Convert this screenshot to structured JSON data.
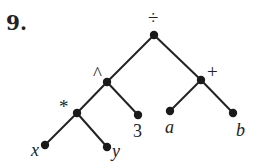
{
  "problem": {
    "number": "9."
  },
  "tree": {
    "nodes": [
      {
        "id": "div",
        "label": "÷",
        "type": "operator",
        "x": 154,
        "y": 35,
        "lx": 148,
        "ly": 24
      },
      {
        "id": "pow",
        "label": "^",
        "type": "operator",
        "x": 107,
        "y": 82,
        "lx": 93,
        "ly": 80
      },
      {
        "id": "plus",
        "label": "+",
        "type": "operator",
        "x": 201,
        "y": 80,
        "lx": 207,
        "ly": 78
      },
      {
        "id": "mul",
        "label": "*",
        "type": "operator",
        "x": 77,
        "y": 113,
        "lx": 59,
        "ly": 113
      },
      {
        "id": "three",
        "label": "3",
        "type": "literal",
        "x": 138,
        "y": 115,
        "lx": 133,
        "ly": 137
      },
      {
        "id": "a",
        "label": "a",
        "type": "variable",
        "x": 170,
        "y": 111,
        "lx": 165,
        "ly": 133
      },
      {
        "id": "b",
        "label": "b",
        "type": "variable",
        "x": 233,
        "y": 113,
        "lx": 236,
        "ly": 136
      },
      {
        "id": "x",
        "label": "x",
        "type": "variable",
        "x": 45,
        "y": 145,
        "lx": 31,
        "ly": 156
      },
      {
        "id": "y",
        "label": "y",
        "type": "variable",
        "x": 107,
        "y": 147,
        "lx": 112,
        "ly": 157
      }
    ],
    "edges": [
      {
        "from": "div",
        "to": "pow"
      },
      {
        "from": "div",
        "to": "plus"
      },
      {
        "from": "pow",
        "to": "mul"
      },
      {
        "from": "pow",
        "to": "three"
      },
      {
        "from": "plus",
        "to": "a"
      },
      {
        "from": "plus",
        "to": "b"
      },
      {
        "from": "mul",
        "to": "x"
      },
      {
        "from": "mul",
        "to": "y"
      }
    ],
    "expression": "(x * y) ^ 3 ÷ (a + b)"
  }
}
